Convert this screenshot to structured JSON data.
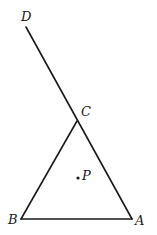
{
  "diagram": {
    "type": "geometry",
    "points": {
      "D": {
        "label": "D",
        "x": 26,
        "y": 27,
        "label_x": 21,
        "label_y": 21
      },
      "C": {
        "label": "C",
        "x": 77,
        "y": 121,
        "label_x": 81,
        "label_y": 116
      },
      "B": {
        "label": "B",
        "x": 21,
        "y": 219,
        "label_x": 8,
        "label_y": 224
      },
      "A": {
        "label": "A",
        "x": 132,
        "y": 219,
        "label_x": 135,
        "label_y": 225
      },
      "P": {
        "label": "P",
        "x": 78,
        "y": 178,
        "label_x": 82,
        "label_y": 180
      }
    },
    "segments": [
      {
        "from": "D",
        "to": "A",
        "description": "line DA passing through C"
      },
      {
        "from": "B",
        "to": "C"
      },
      {
        "from": "B",
        "to": "A"
      }
    ],
    "marked_point": "P",
    "stroke_color": "#1a1a1a",
    "background": "#ffffff"
  }
}
